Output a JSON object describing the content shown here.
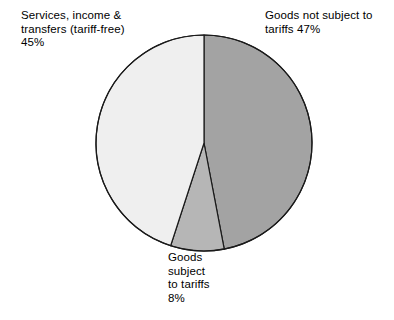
{
  "chart_data": {
    "type": "pie",
    "title": "",
    "subtitle": "",
    "xlabel": "",
    "ylabel": "",
    "legend_position": "none",
    "grid": false,
    "start_angle_deg": 0,
    "direction": "clockwise",
    "units": "percent",
    "categories": [
      "Goods not subject to tariffs",
      "Goods subject to tariffs",
      "Services, income & transfers (tariff-free)"
    ],
    "values": [
      47,
      8,
      45
    ],
    "slices": [
      {
        "name": "goods-not-subject-to-tariffs",
        "category": "Goods not subject to tariffs",
        "value": 47,
        "value_text": "47%",
        "color": "#a3a3a3",
        "label_lines": [
          "Goods not subject to",
          "tariffs 47%"
        ],
        "label_text": "Goods not subject to\ntariffs 47%",
        "label_position": "top-right"
      },
      {
        "name": "goods-subject-to-tariffs",
        "category": "Goods subject to tariffs",
        "value": 8,
        "value_text": "8%",
        "color": "#b6b6b6",
        "label_lines": [
          "Goods",
          "subject",
          "to tariffs",
          "8%"
        ],
        "label_text": "Goods\nsubject\nto tariffs\n8%",
        "label_position": "bottom-center"
      },
      {
        "name": "services-income-transfers",
        "category": "Services, income & transfers (tariff-free)",
        "value": 45,
        "value_text": "45%",
        "color": "#efefef",
        "label_lines": [
          "Services, income &",
          "transfers (tariff-free)",
          "45%"
        ],
        "label_text": "Services, income &\ntransfers (tariff-free)\n45%",
        "label_position": "top-left"
      }
    ],
    "geometry": {
      "center_x": 204,
      "center_y": 143,
      "radius": 108
    },
    "style": {
      "background": "#ffffff",
      "stroke": "#1a1a1a",
      "stroke_width": 1.2,
      "text_color": "#000000"
    }
  }
}
